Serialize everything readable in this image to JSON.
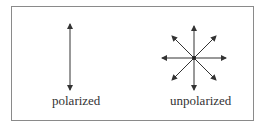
{
  "diagram": {
    "polarized": {
      "label": "polarized",
      "center": [
        70,
        57
      ],
      "arrows": [
        {
          "angle_deg": 90,
          "half_length": 33
        }
      ]
    },
    "unpolarized": {
      "label": "unpolarized",
      "center": [
        194,
        58
      ],
      "arrows": [
        {
          "angle_deg": 0,
          "half_length": 32
        },
        {
          "angle_deg": 45,
          "half_length": 31
        },
        {
          "angle_deg": 90,
          "half_length": 32
        },
        {
          "angle_deg": 135,
          "half_length": 31
        }
      ]
    },
    "colors": {
      "line": "#333333",
      "border": "#8a8a8a"
    }
  }
}
